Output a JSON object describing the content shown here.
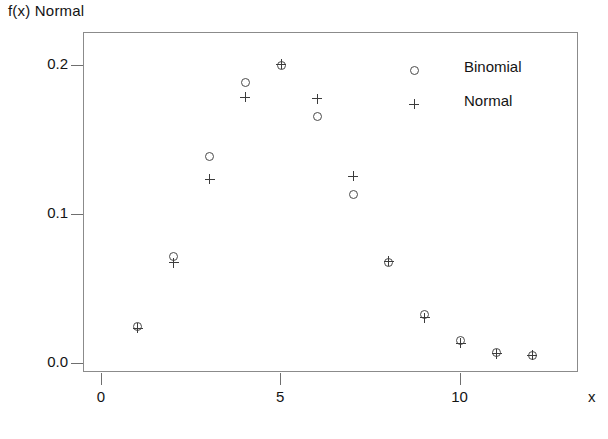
{
  "chart_data": {
    "type": "scatter",
    "title": "",
    "ylabel": "f(x) Normal",
    "xlabel": "x",
    "xlim": [
      -0.5,
      13.3
    ],
    "ylim": [
      -0.006,
      0.222
    ],
    "grid": false,
    "legend_position": "upper-right-inside",
    "xticks": [
      0,
      5,
      10
    ],
    "xtick_labels": [
      "0",
      "5",
      "10"
    ],
    "yticks": [
      0.0,
      0.1,
      0.2
    ],
    "ytick_labels": [
      "0.0",
      "0.1",
      "0.2"
    ],
    "x": [
      1,
      2,
      3,
      4,
      5,
      6,
      7,
      8,
      9,
      10,
      11,
      12
    ],
    "series": [
      {
        "name": "Binomial",
        "marker": "circle",
        "values": [
          0.025,
          0.072,
          0.139,
          0.189,
          0.2,
          0.166,
          0.114,
          0.068,
          0.033,
          0.016,
          0.008,
          0.006
        ]
      },
      {
        "name": "Normal",
        "marker": "plus",
        "values": [
          0.024,
          0.068,
          0.124,
          0.179,
          0.201,
          0.178,
          0.126,
          0.069,
          0.031,
          0.014,
          0.007,
          0.006
        ]
      }
    ],
    "color": "#3c3c3c",
    "frame_color": "#8b8b8b"
  },
  "legend": {
    "items": [
      {
        "label": "Binomial",
        "marker": "circle"
      },
      {
        "label": "Normal",
        "marker": "plus"
      }
    ]
  }
}
